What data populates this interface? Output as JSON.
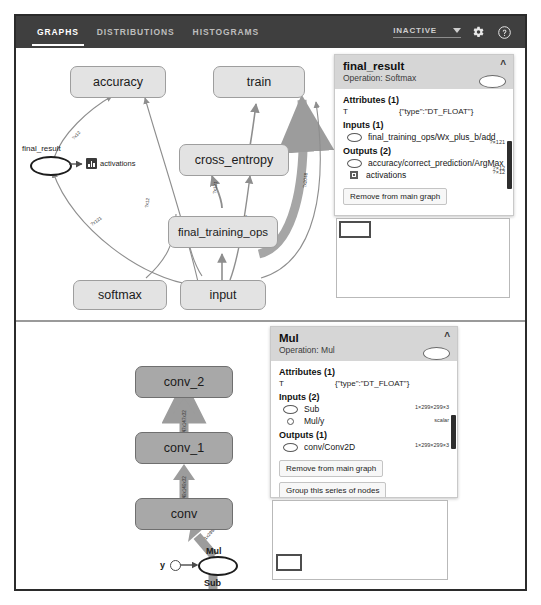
{
  "app": {
    "tabs": [
      {
        "label": "GRAPHS",
        "active": true
      },
      {
        "label": "DISTRIBUTIONS",
        "active": false
      },
      {
        "label": "HISTOGRAMS",
        "active": false
      }
    ],
    "run_selector": {
      "value": "INACTIVE"
    },
    "settings_icon": "gear-icon",
    "help_icon": "help-circle-icon"
  },
  "graph_top": {
    "nodes": [
      {
        "id": "accuracy",
        "label": "accuracy",
        "style": "light"
      },
      {
        "id": "train",
        "label": "train",
        "style": "light"
      },
      {
        "id": "cross_entropy",
        "label": "cross_entropy",
        "style": "light"
      },
      {
        "id": "final_training_ops",
        "label": "final_training_ops",
        "style": "light"
      },
      {
        "id": "softmax",
        "label": "softmax",
        "style": "light"
      },
      {
        "id": "input",
        "label": "input",
        "style": "light"
      }
    ],
    "final_result": {
      "label": "final_result"
    },
    "activations": {
      "label": "activations",
      "icon": "histogram-summary-icon"
    },
    "edge_labels": [
      "?x121",
      "?x12",
      "?x121",
      "2 tensors",
      "?x2048"
    ]
  },
  "graph_bottom": {
    "nodes": [
      {
        "id": "conv_2",
        "label": "conv_2",
        "style": "dark"
      },
      {
        "id": "conv_1",
        "label": "conv_1",
        "style": "dark"
      },
      {
        "id": "conv",
        "label": "conv",
        "style": "dark"
      }
    ],
    "mul_node": {
      "label": "Mul"
    },
    "y_node": {
      "label": "y"
    },
    "sub_node": {
      "label": "Sub"
    },
    "edge_labels": [
      "1x147x147x32",
      "1x149x149x32"
    ]
  },
  "card_top": {
    "title": "final_result",
    "operation": "Operation: Softmax",
    "collapse_icon": "chevron-up-icon",
    "node_glyph": "ellipse-node-icon",
    "attributes_title": "Attributes (1)",
    "attributes": [
      {
        "key": "T",
        "value": "{\"type\":\"DT_FLOAT\"}"
      }
    ],
    "inputs_title": "Inputs (1)",
    "inputs": [
      {
        "icon": "ellipse-node-icon",
        "name": "final_training_ops/Wx_plus_b/add",
        "shape": "?×121"
      }
    ],
    "outputs_title": "Outputs (2)",
    "outputs": [
      {
        "icon": "ellipse-node-icon",
        "name": "accuracy/correct_prediction/ArgMax",
        "shape": "?×12"
      },
      {
        "icon": "summary-square-icon",
        "name": "activations",
        "shape": "?×12"
      }
    ],
    "buttons": [
      {
        "label": "Remove from main graph",
        "name": "remove-from-main-graph-button"
      }
    ]
  },
  "card_bottom": {
    "title": "Mul",
    "operation": "Operation: Mul",
    "collapse_icon": "chevron-up-icon",
    "node_glyph": "ellipse-node-icon",
    "attributes_title": "Attributes (1)",
    "attributes": [
      {
        "key": "T",
        "value": "{\"type\":\"DT_FLOAT\"}"
      }
    ],
    "inputs_title": "Inputs (2)",
    "inputs": [
      {
        "icon": "ellipse-node-icon",
        "name": "Sub",
        "shape": "1×299×299×3"
      },
      {
        "icon": "small-circle-icon",
        "name": "Mul/y",
        "shape": "scalar"
      }
    ],
    "outputs_title": "Outputs (1)",
    "outputs": [
      {
        "icon": "ellipse-node-icon",
        "name": "conv/Conv2D",
        "shape": "1×299×299×3"
      }
    ],
    "buttons": [
      {
        "label": "Remove from main graph",
        "name": "remove-from-main-graph-button"
      },
      {
        "label": "Group this series of nodes",
        "name": "group-series-button"
      }
    ]
  },
  "colors": {
    "toolbar_bg": "#3f3f3f",
    "node_light": "#e3e3e3",
    "node_dark": "#a8a8a8",
    "card_head": "#d6d6d6",
    "edge": "#9a9a9a"
  }
}
